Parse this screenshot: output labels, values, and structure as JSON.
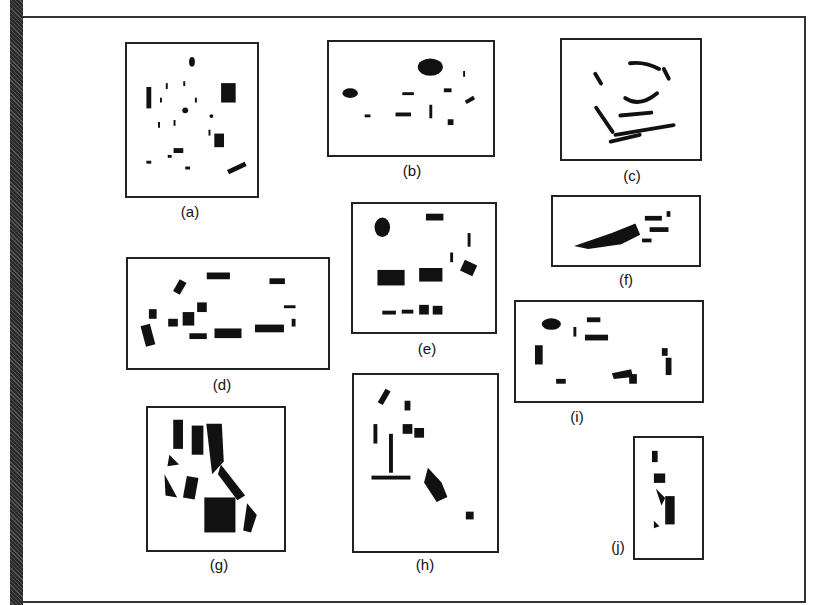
{
  "figure": {
    "panels": [
      {
        "id": "a",
        "label": "(a)"
      },
      {
        "id": "b",
        "label": "(b)"
      },
      {
        "id": "c",
        "label": "(c)"
      },
      {
        "id": "d",
        "label": "(d)"
      },
      {
        "id": "e",
        "label": "(e)"
      },
      {
        "id": "f",
        "label": "(f)"
      },
      {
        "id": "g",
        "label": "(g)"
      },
      {
        "id": "h",
        "label": "(h)"
      },
      {
        "id": "i",
        "label": "(i)"
      },
      {
        "id": "j",
        "label": "(j)"
      }
    ],
    "colors": {
      "ink": "#111111",
      "background": "#ffffff",
      "border": "#222222"
    }
  }
}
